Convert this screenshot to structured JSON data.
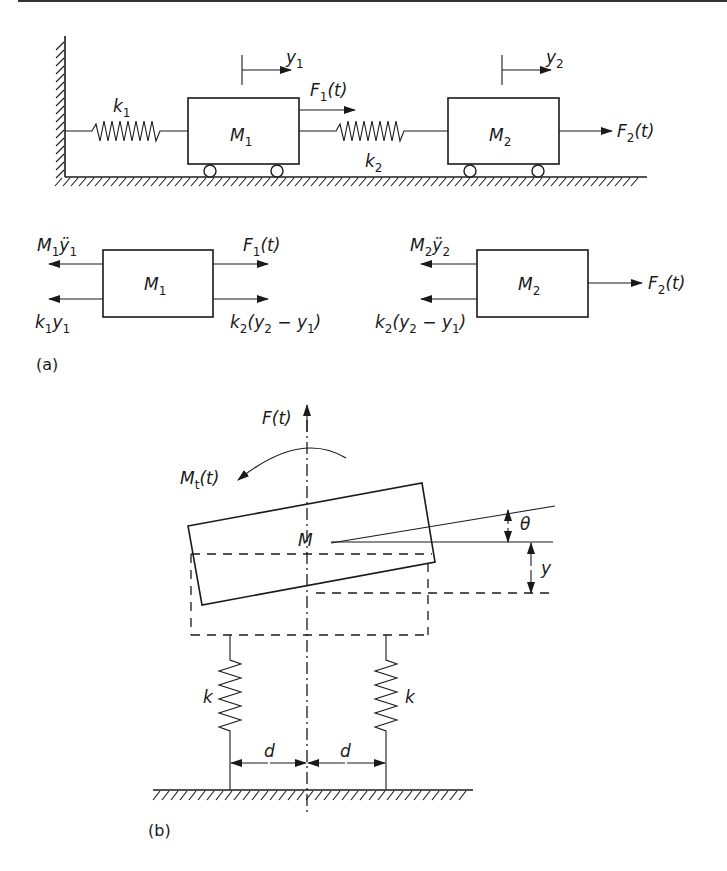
{
  "figure": {
    "part_a": {
      "caption": "(a)",
      "system": {
        "spring_1": {
          "label": "k",
          "sub": "1"
        },
        "spring_2": {
          "label": "k",
          "sub": "2"
        },
        "mass_1": {
          "label": "M",
          "sub": "1"
        },
        "mass_2": {
          "label": "M",
          "sub": "2"
        },
        "displacement_1": {
          "label": "y",
          "sub": "1"
        },
        "displacement_2": {
          "label": "y",
          "sub": "2"
        },
        "force_1": {
          "label": "F",
          "sub": "1",
          "arg": "(t)"
        },
        "force_2": {
          "label": "F",
          "sub": "2",
          "arg": "(t)"
        }
      },
      "fbd_1": {
        "mass": {
          "label": "M",
          "sub": "1"
        },
        "inertia": {
          "label": "M",
          "sub": "1",
          "tail": "ÿ",
          "tail_sub": "1"
        },
        "spring": {
          "label": "k",
          "sub": "1",
          "tail": "y",
          "tail_sub": "1"
        },
        "force": {
          "label": "F",
          "sub": "1",
          "arg": "(t)"
        },
        "coupling": {
          "k": "k",
          "k_sub": "2",
          "open": "(y",
          "y2_sub": "2",
          "minus": " − y",
          "y1_sub": "1",
          "close": ")"
        }
      },
      "fbd_2": {
        "mass": {
          "label": "M",
          "sub": "2"
        },
        "inertia": {
          "label": "M",
          "sub": "2",
          "tail": "ÿ",
          "tail_sub": "2"
        },
        "coupling": {
          "k": "k",
          "k_sub": "2",
          "open": "(y",
          "y2_sub": "2",
          "minus": " − y",
          "y1_sub": "1",
          "close": ")"
        },
        "force": {
          "label": "F",
          "sub": "2",
          "arg": "(t)"
        }
      }
    },
    "part_b": {
      "caption": "(b)",
      "force": {
        "label": "F",
        "arg": "(t)"
      },
      "moment": {
        "label": "M",
        "sub": "t",
        "arg": "(t)"
      },
      "mass": {
        "label": "M"
      },
      "rotation": {
        "label": "θ"
      },
      "translation": {
        "label": "y"
      },
      "spring_left": {
        "label": "k"
      },
      "spring_right": {
        "label": "k"
      },
      "offset_left": {
        "label": "d"
      },
      "offset_right": {
        "label": "d"
      }
    }
  }
}
